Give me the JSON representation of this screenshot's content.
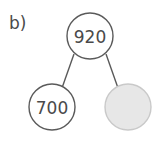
{
  "figure": {
    "item_letter": "b)",
    "type": "number-bond",
    "background_color": "#ffffff",
    "stroke_color": "#5a5a5a",
    "text_color": "#4a4a4a",
    "blank_fill_color": "#e7e7e7",
    "blank_stroke_color": "#c9c9c9",
    "whole": {
      "label": "920",
      "value": 920,
      "cx": 90,
      "cy": 36,
      "r": 23,
      "filled": false
    },
    "parts": [
      {
        "label": "700",
        "value": 700,
        "cx": 52,
        "cy": 107,
        "r": 23,
        "is_blank": false
      },
      {
        "label": "",
        "value": null,
        "cx": 128,
        "cy": 107,
        "r": 23,
        "is_blank": true
      }
    ],
    "connectors": [
      {
        "x1": 74,
        "y1": 54,
        "x2": 62,
        "y2": 88
      },
      {
        "x1": 106,
        "y1": 54,
        "x2": 118,
        "y2": 88
      }
    ]
  }
}
